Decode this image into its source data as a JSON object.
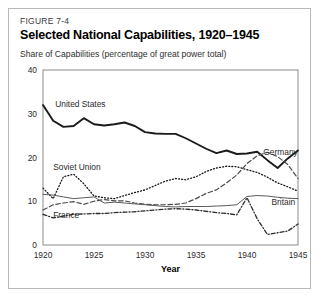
{
  "figure": {
    "number": "FIGURE 7-4",
    "title": "Selected National Capabilities, 1920–1945",
    "subtitle": "Share of Capabilities (percentage of great power total)"
  },
  "chart_data": {
    "type": "line",
    "title": "Selected National Capabilities, 1920–1945",
    "subtitle": "Share of Capabilities (percentage of great power total)",
    "xlabel": "Year",
    "ylabel": "",
    "xlim": [
      1920,
      1945
    ],
    "ylim": [
      0,
      40
    ],
    "xticks": [
      1920,
      1925,
      1930,
      1935,
      1940,
      1945
    ],
    "yticks": [
      0,
      10,
      20,
      30,
      40
    ],
    "grid": false,
    "legend_position": "inline-labels",
    "x": [
      1920,
      1921,
      1922,
      1923,
      1924,
      1925,
      1926,
      1927,
      1928,
      1929,
      1930,
      1931,
      1932,
      1933,
      1934,
      1935,
      1936,
      1937,
      1938,
      1939,
      1940,
      1941,
      1942,
      1943,
      1944,
      1945
    ],
    "series": [
      {
        "name": "United States",
        "style": "solid-thick",
        "color": "#1a1a1a",
        "label_x": 1921.2,
        "label_y": 31.5,
        "values": [
          32.0,
          28.4,
          27.0,
          27.2,
          29.0,
          27.6,
          27.3,
          27.6,
          28.0,
          27.2,
          25.8,
          25.5,
          25.4,
          25.4,
          24.4,
          23.2,
          22.0,
          21.0,
          21.6,
          20.8,
          20.9,
          21.3,
          19.4,
          17.6,
          19.8,
          21.6
        ]
      },
      {
        "name": "Soviet Union",
        "style": "dotted",
        "color": "#1a1a1a",
        "label_x": 1921.0,
        "label_y": 17.2,
        "values": [
          13.0,
          10.6,
          15.6,
          16.2,
          14.0,
          11.2,
          10.8,
          10.6,
          11.3,
          12.0,
          12.6,
          13.6,
          14.6,
          15.2,
          14.9,
          15.6,
          16.8,
          17.6,
          18.0,
          17.9,
          17.2,
          16.6,
          15.5,
          14.2,
          13.3,
          12.3
        ]
      },
      {
        "name": "Germany",
        "style": "dashed",
        "color": "#4a4a4a",
        "label_x": 1941.6,
        "label_y": 20.6,
        "values": [
          8.0,
          9.2,
          9.6,
          9.9,
          9.3,
          10.0,
          10.4,
          10.1,
          10.1,
          9.6,
          9.3,
          9.2,
          9.2,
          9.3,
          9.6,
          10.6,
          11.8,
          12.6,
          14.2,
          16.0,
          18.6,
          20.4,
          21.2,
          20.2,
          18.4,
          15.2
        ]
      },
      {
        "name": "Britain",
        "style": "solid-thin",
        "color": "#5a5a5a",
        "label_x": 1942.4,
        "label_y": 9.1,
        "values": [
          11.6,
          11.4,
          11.0,
          10.6,
          10.8,
          11.0,
          9.6,
          9.8,
          9.6,
          9.4,
          9.2,
          9.0,
          8.8,
          8.7,
          8.8,
          8.8,
          8.8,
          8.9,
          9.0,
          9.2,
          11.1,
          11.3,
          11.2,
          10.9,
          10.7,
          10.6
        ]
      },
      {
        "name": "France",
        "style": "dash-dot",
        "color": "#2b2b2b",
        "label_x": 1921.0,
        "label_y": 6.2,
        "values": [
          7.0,
          6.2,
          6.6,
          7.0,
          7.1,
          7.2,
          7.2,
          7.4,
          7.5,
          7.6,
          7.8,
          8.0,
          8.2,
          8.3,
          8.2,
          8.0,
          7.7,
          7.4,
          7.2,
          6.9,
          10.8,
          6.0,
          2.4,
          2.8,
          3.2,
          4.8
        ]
      }
    ]
  }
}
